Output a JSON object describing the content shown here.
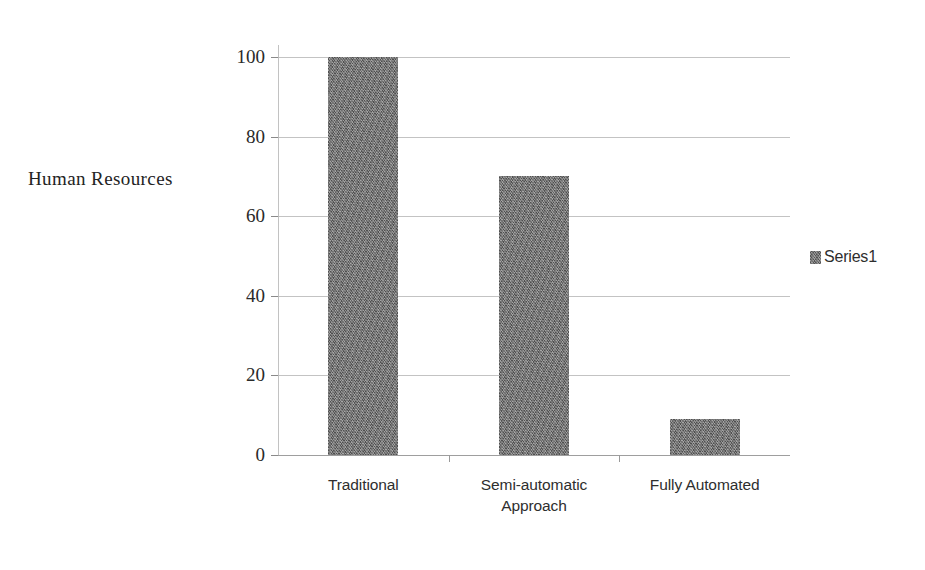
{
  "chart_data": {
    "type": "bar",
    "title": "",
    "xlabel": "",
    "ylabel": "Human Resources",
    "categories": [
      "Traditional",
      "Semi-automatic Approach",
      "Fully Automated"
    ],
    "category_lines": [
      [
        "Traditional"
      ],
      [
        "Semi-automatic",
        "Approach"
      ],
      [
        "Fully Automated"
      ]
    ],
    "values": [
      100,
      70,
      9
    ],
    "series": [
      {
        "name": "Series1",
        "values": [
          100,
          70,
          9
        ]
      }
    ],
    "ylim": [
      0,
      100
    ],
    "yticks": [
      0,
      20,
      40,
      60,
      80,
      100
    ],
    "ytick_labels": [
      "0",
      "20",
      "40",
      "60",
      "80",
      "100"
    ],
    "grid": true,
    "legend_position": "right",
    "bar_color": "#6d6d6d",
    "gridline_color": "#b9b9b9",
    "background_color": "#ffffff",
    "text_color": "#2a2a2a"
  },
  "legend": {
    "entries": [
      {
        "label": "Series1",
        "color": "#6d6d6d",
        "swatch_icon": "legend-swatch-icon"
      }
    ]
  }
}
